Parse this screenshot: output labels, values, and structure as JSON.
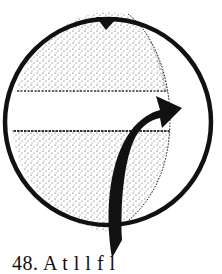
{
  "figure": {
    "elements": {
      "outer_circle": "circle-outline",
      "inner_stippled_region": "stippled-lens",
      "equatorial_band": "white-band",
      "top_marker": "triangle-marker-icon",
      "curved_arrow": "curved-arrow-icon"
    },
    "colors": {
      "ink": "#111111",
      "stipple": "#333333",
      "paper": "#ffffff"
    }
  },
  "caption": {
    "text": "48. A              t l  l f l"
  }
}
